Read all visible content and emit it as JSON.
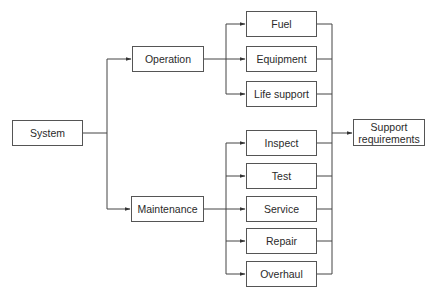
{
  "diagram": {
    "type": "tree-flow",
    "colors": {
      "line": "#444444",
      "border": "#555555",
      "text": "#2a2a2a",
      "background": "#ffffff"
    },
    "root": {
      "label": "System"
    },
    "branches": [
      {
        "label": "Operation",
        "children": [
          "Fuel",
          "Equipment",
          "Life support"
        ]
      },
      {
        "label": "Maintenance",
        "children": [
          "Inspect",
          "Test",
          "Service",
          "Repair",
          "Overhaul"
        ]
      }
    ],
    "sink": {
      "label": "Support requirements",
      "line1": "Support",
      "line2": "requirements"
    },
    "nodes": {
      "system": "System",
      "operation": "Operation",
      "maintenance": "Maintenance",
      "fuel": "Fuel",
      "equipment": "Equipment",
      "life_support": "Life support",
      "inspect": "Inspect",
      "test": "Test",
      "service": "Service",
      "repair": "Repair",
      "overhaul": "Overhaul"
    }
  }
}
